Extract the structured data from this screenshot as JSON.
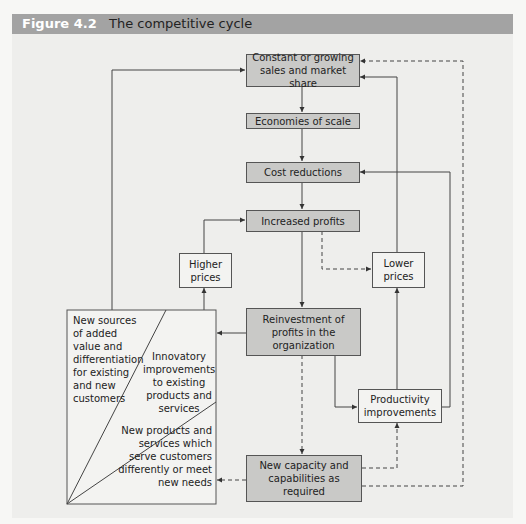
{
  "header": {
    "figure_number": "Figure 4.2",
    "title": "The competitive cycle",
    "bar_color": "#a3a3a3"
  },
  "nodes": {
    "sales": "Constant or growing sales and market share",
    "economies": "Economies of scale",
    "cost": "Cost reductions",
    "profits": "Increased profits",
    "higher_prices": "Higher prices",
    "lower_prices": "Lower prices",
    "reinvestment": "Reinvestment of profits in the organization",
    "productivity": "Productivity improvements",
    "capacity": "New capacity and capabilities as required"
  },
  "outcomes_box": {
    "segment_1": "New sources of added value and differentiation for existing and new customers",
    "segment_2": "Innovatory improvements to existing products and services",
    "segment_3": "New products and services which serve customers differently or meet new needs"
  },
  "edges": [
    {
      "from": "sales",
      "to": "economies",
      "style": "solid"
    },
    {
      "from": "economies",
      "to": "cost",
      "style": "solid"
    },
    {
      "from": "cost",
      "to": "profits",
      "style": "solid"
    },
    {
      "from": "profits",
      "to": "reinvestment",
      "style": "solid"
    },
    {
      "from": "profits",
      "to": "lower_prices",
      "style": "dashed"
    },
    {
      "from": "higher_prices",
      "to": "profits",
      "style": "solid"
    },
    {
      "from": "lower_prices",
      "to": "sales",
      "style": "solid"
    },
    {
      "from": "reinvestment",
      "to": "outcomes_box",
      "style": "solid"
    },
    {
      "from": "reinvestment",
      "to": "productivity",
      "style": "solid"
    },
    {
      "from": "reinvestment",
      "to": "capacity",
      "style": "dashed"
    },
    {
      "from": "productivity",
      "to": "lower_prices",
      "style": "solid"
    },
    {
      "from": "productivity",
      "to": "cost",
      "style": "solid"
    },
    {
      "from": "capacity",
      "to": "productivity",
      "style": "dashed"
    },
    {
      "from": "capacity",
      "to": "sales",
      "style": "dashed"
    },
    {
      "from": "capacity",
      "to": "outcomes_box",
      "style": "dashed"
    },
    {
      "from": "outcomes_box",
      "to": "higher_prices",
      "style": "solid"
    },
    {
      "from": "outcomes_box",
      "to": "sales",
      "style": "solid"
    }
  ]
}
